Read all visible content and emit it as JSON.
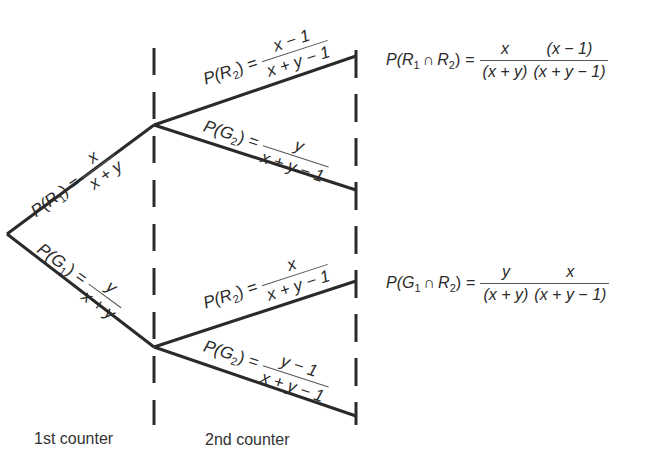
{
  "diagram": {
    "type": "probability-tree",
    "stages": [
      {
        "label": "1st counter"
      },
      {
        "label": "2nd counter"
      }
    ],
    "branches_level1": [
      {
        "event": "R",
        "subscript": "1",
        "prob_label": "P(R1)",
        "numerator": "x",
        "denominator": "x + y"
      },
      {
        "event": "G",
        "subscript": "1",
        "prob_label": "P(G1)",
        "numerator": "y",
        "denominator": "x + y"
      }
    ],
    "branches_level2": {
      "after_R1": [
        {
          "event": "R",
          "subscript": "2",
          "numerator": "x − 1",
          "denominator": "x + y − 1"
        },
        {
          "event": "G",
          "subscript": "2",
          "numerator": "y",
          "denominator": "x + y − 1"
        }
      ],
      "after_G1": [
        {
          "event": "R",
          "subscript": "2",
          "numerator": "x",
          "denominator": "x + y − 1"
        },
        {
          "event": "G",
          "subscript": "2",
          "numerator": "y − 1",
          "denominator": "x + y − 1"
        }
      ]
    },
    "results": [
      {
        "lhs_prefix": "P(",
        "e1": "R",
        "s1": "1",
        "cap": "∩",
        "e2": "R",
        "s2": "2",
        "lhs_suffix": ")",
        "eq": "=",
        "f1_num": "x",
        "f1_den": "(x + y)",
        "f2_num": "(x − 1)",
        "f2_den": "(x + y − 1)"
      },
      {
        "lhs_prefix": "P(",
        "e1": "G",
        "s1": "1",
        "cap": "∩",
        "e2": "R",
        "s2": "2",
        "lhs_suffix": ")",
        "eq": "=",
        "f1_num": "y",
        "f1_den": "(x + y)",
        "f2_num": "x",
        "f2_den": "(x + y − 1)"
      }
    ],
    "common": {
      "P": "P(",
      "close": ")",
      "eq": "="
    },
    "colors": {
      "line": "#2a2a2a",
      "background": "#ffffff"
    }
  }
}
